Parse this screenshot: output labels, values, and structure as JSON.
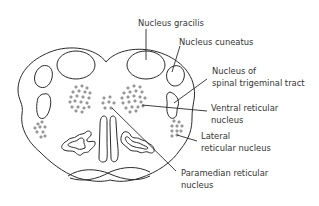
{
  "diagram": {
    "line_color": "#2a2a2a",
    "text_color": "#333333",
    "background": "#ffffff",
    "labels": {
      "nucleus_gracilis": "Nucleus gracilis",
      "nucleus_cuneatus": "Nucleus cuneatus",
      "spinal_trigeminal_line1": "Nucleus of",
      "spinal_trigeminal_line2": "spinal trigeminal tract",
      "ventral_reticular_line1": "Ventral reticular",
      "ventral_reticular_line2": "nucleus",
      "lateral_reticular_line1": "Lateral",
      "lateral_reticular_line2": "reticular nucleus",
      "paramedian_reticular_line1": "Paramedian reticular",
      "paramedian_reticular_line2": "nucleus"
    }
  }
}
